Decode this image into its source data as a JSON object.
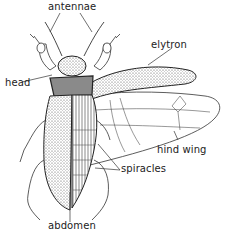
{
  "diagram": {
    "labels": {
      "antennae": "antennae",
      "elytron": "elytron",
      "head": "head",
      "hind_wing": "hind wing",
      "spiracles": "spiracles",
      "abdomen": "abdomen"
    }
  }
}
